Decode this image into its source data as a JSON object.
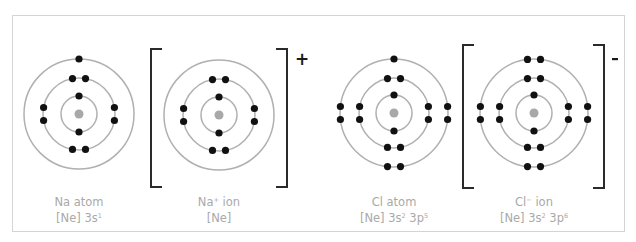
{
  "colors": {
    "ring": "#b0b0b0",
    "nucleus": "#a8a8a8",
    "electron": "#111111",
    "bracket": "#2a2a2a",
    "label": "#a9a9a9"
  },
  "species": [
    {
      "id": "na-atom",
      "name": "Na atom",
      "config_base": "[Ne] 3s",
      "config_parts": [
        {
          "text": "[Ne] 3s",
          "sup": "1"
        }
      ],
      "shells": [
        2,
        8,
        1
      ],
      "bracketed": false,
      "charge": ""
    },
    {
      "id": "na-ion",
      "name_base": "Na",
      "name_sup": "+",
      "name_rest": " ion",
      "config_parts": [
        {
          "text": "[Ne]",
          "sup": ""
        }
      ],
      "shells": [
        2,
        8
      ],
      "bracketed": true,
      "charge": "+"
    },
    {
      "id": "cl-atom",
      "name": "Cl atom",
      "config_parts": [
        {
          "text": "[Ne] 3s",
          "sup": "2"
        },
        {
          "text": " 3p",
          "sup": "5"
        }
      ],
      "shells": [
        2,
        8,
        7
      ],
      "bracketed": false,
      "charge": ""
    },
    {
      "id": "cl-ion",
      "name_base": "Cl",
      "name_sup": "−",
      "name_rest": " ion",
      "config_parts": [
        {
          "text": "[Ne] 3s",
          "sup": "2"
        },
        {
          "text": " 3p",
          "sup": "6"
        }
      ],
      "shells": [
        2,
        8,
        8
      ],
      "bracketed": true,
      "charge": "-"
    }
  ],
  "labels": {
    "na_atom": {
      "line1": "Na atom",
      "line2_a": "[Ne] 3s",
      "line2_a_sup": "1"
    },
    "na_ion": {
      "line1_a": "Na",
      "line1_sup": "+",
      "line1_b": " ion",
      "line2": "[Ne]"
    },
    "cl_atom": {
      "line1": "Cl atom",
      "line2_a": "[Ne] 3s",
      "line2_a_sup": "2",
      "line2_b": " 3p",
      "line2_b_sup": "5"
    },
    "cl_ion": {
      "line1_a": "Cl",
      "line1_sup": "−",
      "line1_b": " ion",
      "line2_a": "[Ne] 3s",
      "line2_a_sup": "2",
      "line2_b": " 3p",
      "line2_b_sup": "6"
    }
  },
  "charges": {
    "na_ion": "+",
    "cl_ion": "-"
  }
}
